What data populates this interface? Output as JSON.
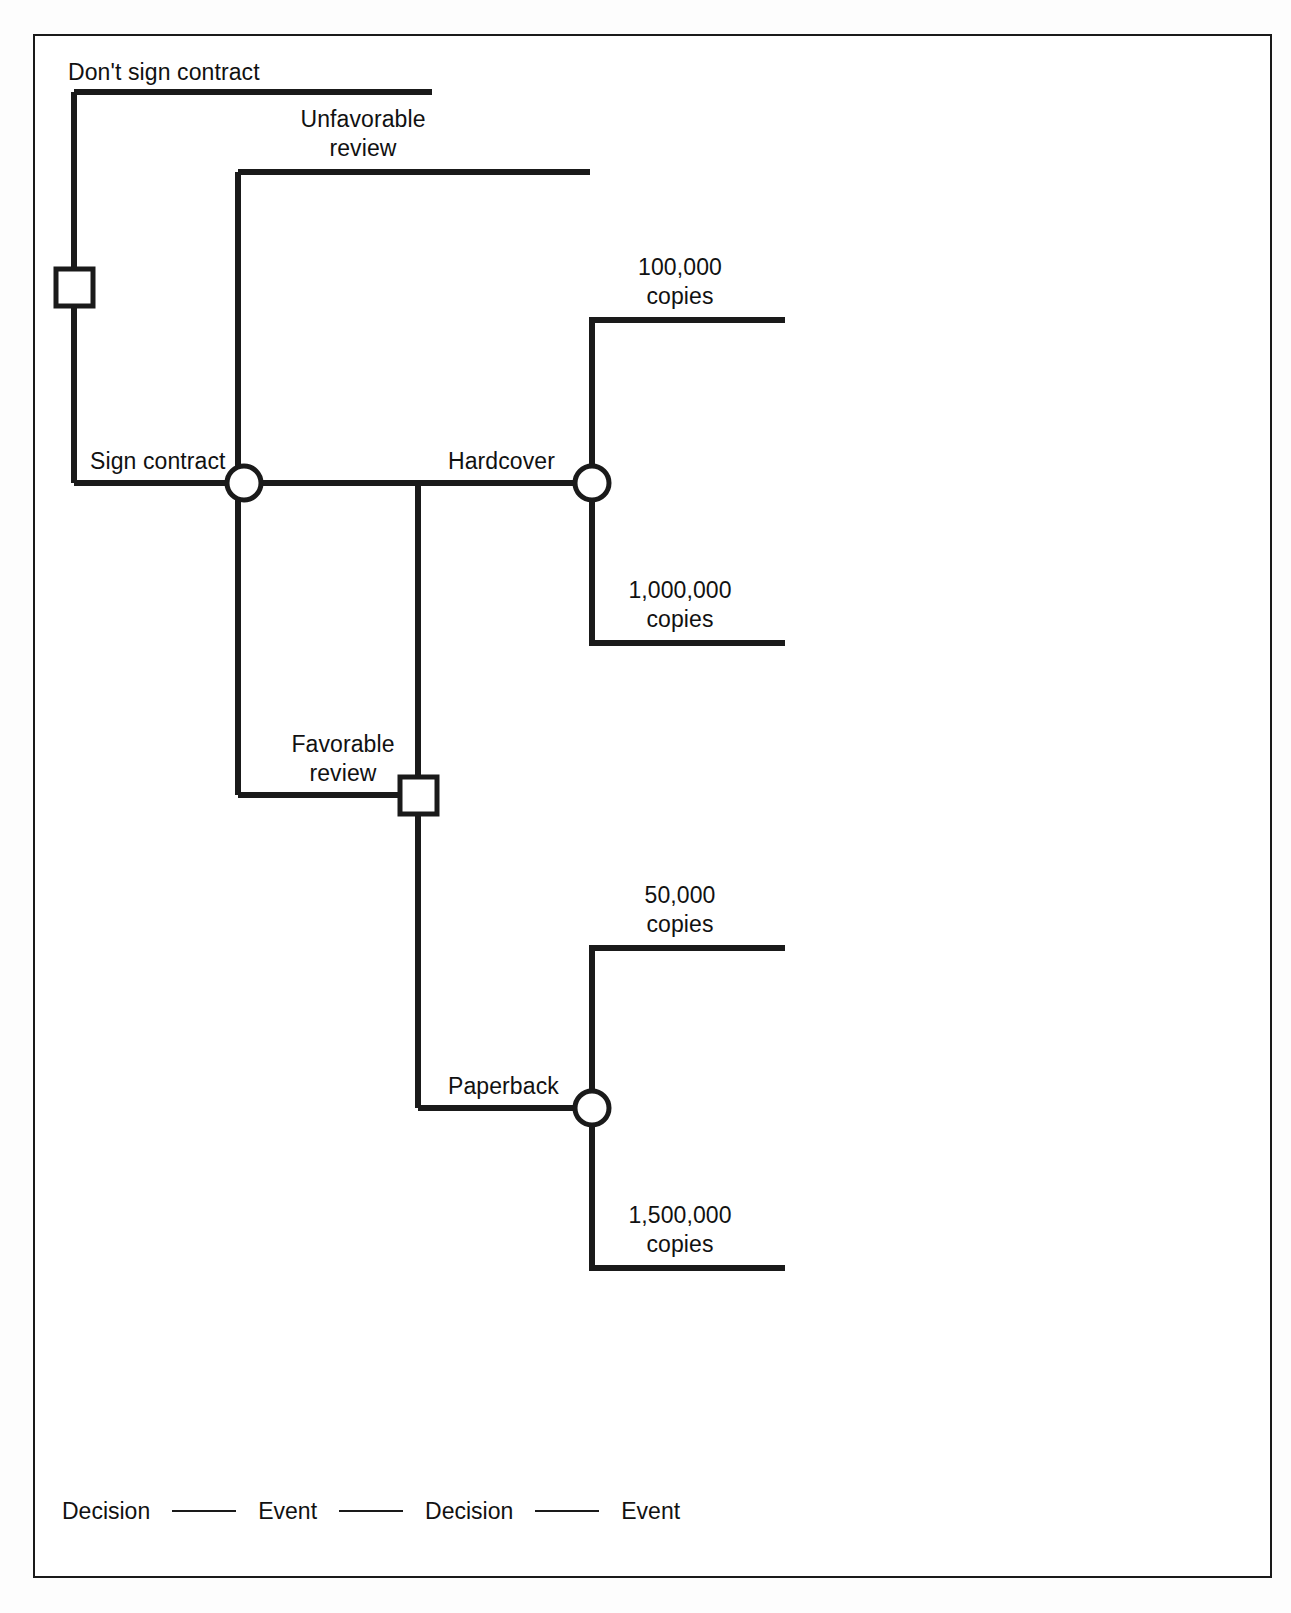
{
  "diagram": {
    "type": "decision-tree",
    "title": "",
    "branch_labels": {
      "dont_sign": "Don't sign contract",
      "sign": "Sign contract",
      "unfavorable": "Unfavorable\nreview",
      "favorable": "Favorable\nreview",
      "hardcover": "Hardcover",
      "paperback": "Paperback"
    },
    "outcomes": {
      "hardcover_low": "100,000\ncopies",
      "hardcover_high": "1,000,000\ncopies",
      "paperback_low": "50,000\ncopies",
      "paperback_high": "1,500,000\ncopies"
    },
    "nodes": [
      {
        "id": "d1",
        "kind": "decision",
        "shape": "square",
        "label": ""
      },
      {
        "id": "e1",
        "kind": "event",
        "shape": "circle",
        "label": ""
      },
      {
        "id": "d2",
        "kind": "decision",
        "shape": "square",
        "label": ""
      },
      {
        "id": "e2",
        "kind": "event",
        "shape": "circle",
        "label": ""
      },
      {
        "id": "e3",
        "kind": "event",
        "shape": "circle",
        "label": ""
      }
    ],
    "colors": {
      "line": "#1a1a1a",
      "node_fill": "#ffffff",
      "frame": "#1a1a1a",
      "background": "#ffffff",
      "text": "#111111"
    }
  },
  "legend": {
    "items": [
      "Decision",
      "Event",
      "Decision",
      "Event"
    ],
    "separator": "—"
  }
}
